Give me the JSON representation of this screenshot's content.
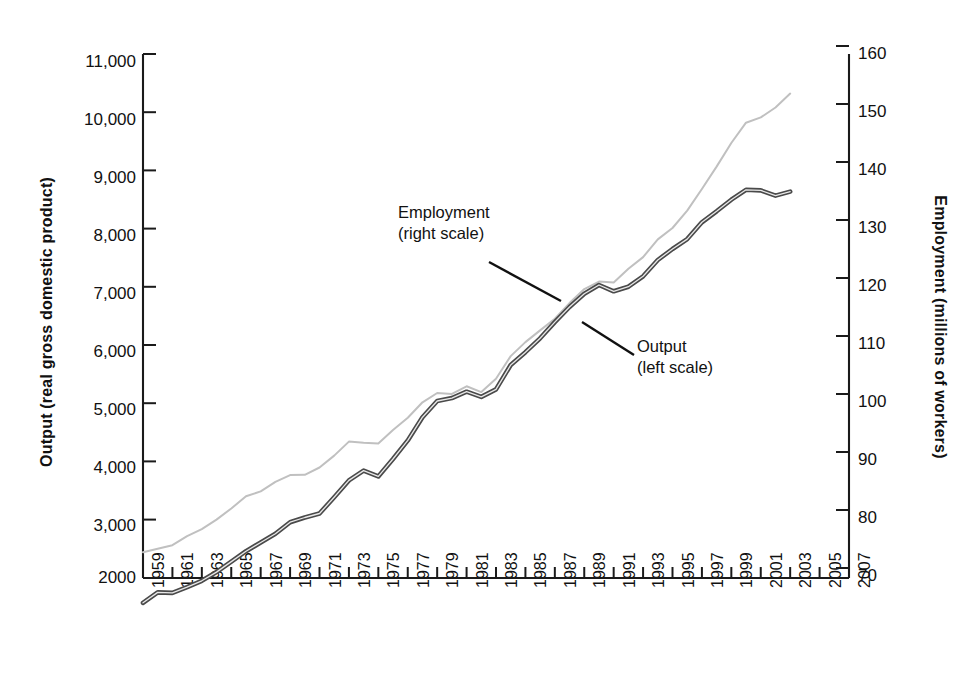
{
  "chart_data": {
    "type": "line",
    "title": "",
    "xlabel": "",
    "ylabel": "Output  (real gross domestic product)",
    "y2label": "Employment (millions of workers)",
    "xlim": [
      1959,
      2007
    ],
    "ylim": [
      2000,
      11000
    ],
    "y2lim": [
      65,
      160
    ],
    "grid": false,
    "legend_position": "inline-annotations",
    "xticks": [
      "1959",
      "1961",
      "1963",
      "1965",
      "1967",
      "1969",
      "1971",
      "1973",
      "1975",
      "1977",
      "1979",
      "1981",
      "1983",
      "1985",
      "1987",
      "1989",
      "1991",
      "1993",
      "1995",
      "1997",
      "1999",
      "2001",
      "2003",
      "2005",
      "2007"
    ],
    "yticks_left": [
      "11,000",
      "10,000",
      "9,000",
      "8,000",
      "7,000",
      "6,000",
      "5,000",
      "4,000",
      "3,000",
      "2000"
    ],
    "yticks_right": [
      "160",
      "150",
      "140",
      "130",
      "120",
      "110",
      "100",
      "90",
      "80",
      "70"
    ],
    "annotations": [
      {
        "name": "employment-label",
        "text": "Employment\n(right scale)",
        "points_to_series": "Employment"
      },
      {
        "name": "output-label",
        "text": "Output\n(left scale)",
        "points_to_series": "Output"
      }
    ],
    "x": [
      1959,
      1960,
      1961,
      1962,
      1963,
      1964,
      1965,
      1966,
      1967,
      1968,
      1969,
      1970,
      1971,
      1972,
      1973,
      1974,
      1975,
      1976,
      1977,
      1978,
      1979,
      1980,
      1981,
      1982,
      1983,
      1984,
      1985,
      1986,
      1987,
      1988,
      1989,
      1990,
      1991,
      1992,
      1993,
      1994,
      1995,
      1996,
      1997,
      1998,
      1999,
      2000,
      2001,
      2002,
      2003
    ],
    "series": [
      {
        "name": "Output",
        "axis": "left",
        "units": "billions of chained dollars (real GDP)",
        "color": "#bcbcbc",
        "style": "thin light gray line",
        "values": [
          2440,
          2500,
          2560,
          2715,
          2835,
          3000,
          3190,
          3400,
          3485,
          3650,
          3765,
          3770,
          3895,
          4100,
          4340,
          4320,
          4310,
          4540,
          4750,
          5015,
          5175,
          5160,
          5290,
          5190,
          5420,
          5810,
          6050,
          6250,
          6450,
          6720,
          6960,
          7090,
          7075,
          7310,
          7510,
          7815,
          8010,
          8310,
          8680,
          9065,
          9470,
          9820,
          9910,
          10080,
          10320
        ]
      },
      {
        "name": "Employment",
        "axis": "right",
        "units": "millions of workers",
        "color": "#3a3a3a",
        "style": "thick dark gray line",
        "values": [
          64.0,
          65.8,
          65.7,
          66.7,
          67.8,
          69.3,
          71.1,
          72.9,
          74.4,
          75.9,
          77.9,
          78.7,
          79.4,
          82.2,
          85.1,
          86.8,
          85.8,
          88.8,
          92.0,
          96.0,
          98.8,
          99.3,
          100.4,
          99.5,
          100.8,
          105.0,
          107.2,
          109.6,
          112.4,
          115.0,
          117.3,
          118.8,
          117.7,
          118.5,
          120.3,
          123.1,
          125.0,
          126.7,
          129.6,
          131.5,
          133.5,
          135.2,
          135.1,
          134.2,
          134.9
        ]
      }
    ]
  }
}
